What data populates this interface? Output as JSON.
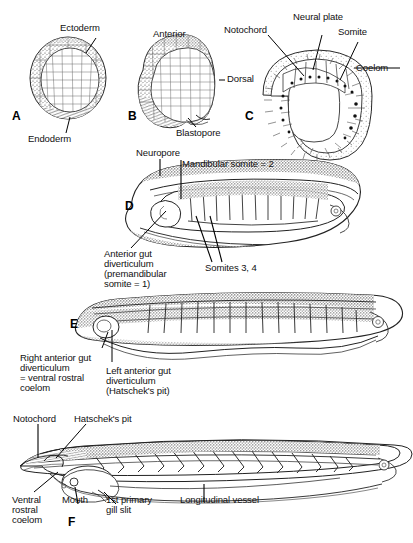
{
  "figure": {
    "background_color": "#ffffff",
    "ink_color": "#1a1a1a",
    "panel_count": 6
  },
  "panels": [
    {
      "letter": "A",
      "name": "gastrula-cross-section",
      "labels": [
        {
          "text": "Ectoderm",
          "name": "label-ectoderm"
        },
        {
          "text": "Endoderm",
          "name": "label-endoderm"
        }
      ]
    },
    {
      "letter": "B",
      "name": "late-gastrula-external-view",
      "labels": [
        {
          "text": "Anterior",
          "name": "label-anterior"
        },
        {
          "text": "Dorsal",
          "name": "label-dorsal"
        },
        {
          "text": "Blastopore",
          "name": "label-blastopore"
        }
      ]
    },
    {
      "letter": "C",
      "name": "neurula-transverse-section",
      "labels": [
        {
          "text": "Notochord",
          "name": "label-notochord"
        },
        {
          "text": "Neural plate",
          "name": "label-neural-plate"
        },
        {
          "text": "Somite",
          "name": "label-somite"
        },
        {
          "text": "Coelom",
          "name": "label-coelom"
        }
      ]
    },
    {
      "letter": "D",
      "name": "early-larva-sagittal",
      "labels": [
        {
          "text": "Neuropore",
          "name": "label-neuropore"
        },
        {
          "text": "Mandibular somite = 2",
          "name": "label-mandibular-somite"
        },
        {
          "text": "Anterior gut",
          "name": "label-anterior-gut-line1"
        },
        {
          "text": "diverticulum",
          "name": "label-anterior-gut-line2"
        },
        {
          "text": "(premandibular",
          "name": "label-anterior-gut-line3"
        },
        {
          "text": "somite = 1)",
          "name": "label-anterior-gut-line4"
        },
        {
          "text": "Somites 3, 4",
          "name": "label-somites-3-4"
        }
      ]
    },
    {
      "letter": "E",
      "name": "elongating-larva-sagittal",
      "labels": [
        {
          "text": "Right anterior gut",
          "name": "label-right-agd-line1"
        },
        {
          "text": "diverticulum",
          "name": "label-right-agd-line2"
        },
        {
          "text": "= ventral rostral",
          "name": "label-right-agd-line3"
        },
        {
          "text": "coelom",
          "name": "label-right-agd-line4"
        },
        {
          "text": "Left anterior gut",
          "name": "label-left-agd-line1"
        },
        {
          "text": "diverticulum",
          "name": "label-left-agd-line2"
        },
        {
          "text": "(Hatschek's pit)",
          "name": "label-left-agd-line3"
        }
      ]
    },
    {
      "letter": "F",
      "name": "advanced-larva-sagittal",
      "labels": [
        {
          "text": "Notochord",
          "name": "label-notochord-f"
        },
        {
          "text": "Hatschek's pit",
          "name": "label-hatscheks-pit"
        },
        {
          "text": "Ventral",
          "name": "label-ventral-rostral-line1"
        },
        {
          "text": "rostral",
          "name": "label-ventral-rostral-line2"
        },
        {
          "text": "coelom",
          "name": "label-ventral-rostral-line3"
        },
        {
          "text": "Mouth",
          "name": "label-mouth"
        },
        {
          "text": "1st primary",
          "name": "label-gill-slit-line1"
        },
        {
          "text": "gill slit",
          "name": "label-gill-slit-line2"
        },
        {
          "text": "Longitudinal vessel",
          "name": "label-longitudinal-vessel"
        }
      ]
    }
  ]
}
